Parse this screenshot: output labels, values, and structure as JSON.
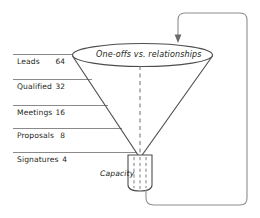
{
  "diagram": {
    "type": "sales-funnel",
    "ellipse_caption": "One-offs vs. relationships",
    "capacity_caption": "Capacity",
    "stages": [
      {
        "label": "Leads",
        "value": "64"
      },
      {
        "label": "Qualified",
        "value": "32"
      },
      {
        "label": "Meetings",
        "value": "16"
      },
      {
        "label": "Proposals",
        "value": "8"
      },
      {
        "label": "Signatures",
        "value": "4"
      }
    ],
    "colors": {
      "outline": "#4d4d4d",
      "leader": "#8a8a8a",
      "loop": "#8e8e8e",
      "text": "#231f20",
      "background": "#ffffff"
    },
    "feedback_loop": {
      "description": "return-arrow-from-stem-to-funnel-top",
      "arrow_direction": "down"
    }
  }
}
